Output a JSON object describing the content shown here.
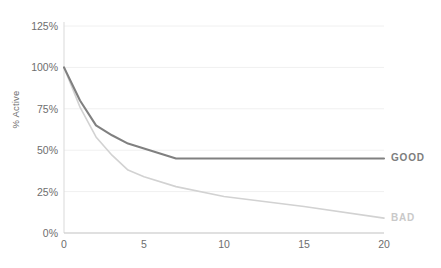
{
  "chart_data": {
    "type": "line",
    "title": "",
    "subtitle": "",
    "xlabel": "",
    "ylabel": "% Active",
    "xlim": [
      0,
      20
    ],
    "ylim": [
      0,
      125
    ],
    "grid": true,
    "grid_axis": "y",
    "legend_position": "right-inline",
    "x_ticks": [
      "0",
      "5",
      "10",
      "15",
      "20"
    ],
    "x_tick_values": [
      0,
      5,
      10,
      15,
      20
    ],
    "y_ticks": [
      "0%",
      "25%",
      "50%",
      "75%",
      "100%",
      "125%"
    ],
    "y_tick_values": [
      0,
      25,
      50,
      75,
      100,
      125
    ],
    "series": [
      {
        "name": "GOOD",
        "color": "#808080",
        "x": [
          0,
          1,
          2,
          3,
          4,
          5,
          6,
          7,
          10,
          15,
          20
        ],
        "values": [
          100,
          80,
          65,
          59,
          54,
          51,
          48,
          45,
          45,
          45,
          45
        ]
      },
      {
        "name": "BAD",
        "color": "#d2d2d2",
        "x": [
          0,
          1,
          2,
          3,
          4,
          5,
          7,
          10,
          15,
          20
        ],
        "values": [
          100,
          76,
          58,
          47,
          38,
          34,
          28,
          22,
          16,
          9
        ]
      }
    ]
  },
  "axes": {
    "y_axis_title": "% Active"
  },
  "legend": {
    "good_label": "GOOD",
    "bad_label": "BAD"
  }
}
